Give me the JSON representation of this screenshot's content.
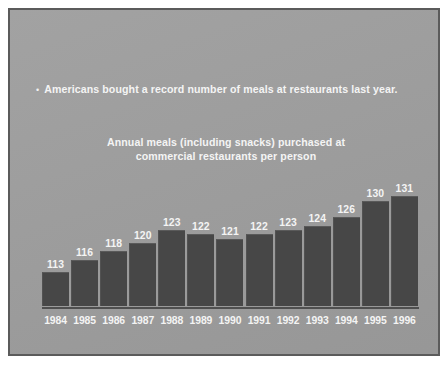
{
  "slide": {
    "bullet_marker": "•",
    "bullet_text": "Americans bought a record number of meals at restaurants last year.",
    "title_line1": "Annual meals (including snacks) purchased at",
    "title_line2": "commercial restaurants per person",
    "background_color": "#9d9d9d",
    "border_color": "#5b5b5b",
    "text_color": "#f4f4f4",
    "bar_color": "#474747"
  },
  "chart_data": {
    "type": "bar",
    "title": "Annual meals (including snacks) purchased at commercial restaurants per person",
    "subtitle": "",
    "xlabel": "",
    "ylabel": "",
    "grid": false,
    "legend": "none",
    "categories": [
      "1984",
      "1985",
      "1986",
      "1987",
      "1988",
      "1989",
      "1990",
      "1991",
      "1992",
      "1993",
      "1994",
      "1995",
      "1996"
    ],
    "values": [
      113,
      116,
      118,
      120,
      123,
      122,
      121,
      122,
      123,
      124,
      126,
      130,
      131
    ],
    "ylim": [
      105,
      133
    ],
    "value_labels": [
      "113",
      "116",
      "118",
      "120",
      "123",
      "122",
      "121",
      "122",
      "123",
      "124",
      "126",
      "130",
      "131"
    ],
    "bar_color": "#474747"
  }
}
